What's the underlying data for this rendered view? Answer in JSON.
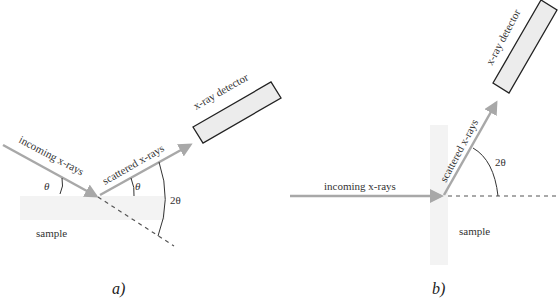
{
  "panels": [
    {
      "id": "a",
      "caption": "a)",
      "labels": {
        "incoming": "incoming x-rays",
        "scattered": "scattered x-rays",
        "detector": "x-ray detector",
        "sample": "sample",
        "theta_in": "θ",
        "theta_out": "θ",
        "two_theta": "2θ"
      }
    },
    {
      "id": "b",
      "caption": "b)",
      "labels": {
        "incoming": "incoming x-rays",
        "scattered": "scattered x-rays",
        "detector": "x-ray detector",
        "sample": "sample",
        "two_theta": "2θ"
      }
    }
  ],
  "colors": {
    "beam": "#a8a8a8",
    "detector_fill": "#ececec",
    "detector_stroke": "#222222",
    "sample_fill": "#f2f2f2",
    "dashed": "#555555"
  }
}
